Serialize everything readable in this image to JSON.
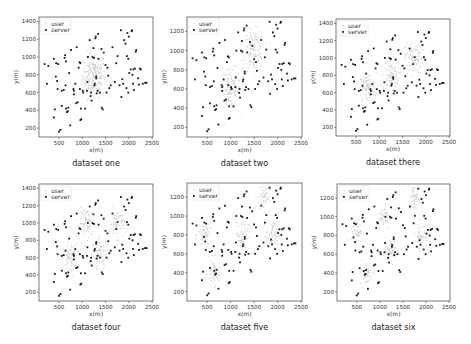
{
  "chart_data": [
    {
      "type": "scatter",
      "title": "dataset one",
      "xlabel": "x(m)",
      "ylabel": "y(m)",
      "xlim": [
        70,
        2520
      ],
      "ylim": [
        100,
        1450
      ],
      "xticks": [
        500,
        1000,
        1500,
        2000,
        2500
      ],
      "yticks": [
        200,
        400,
        600,
        800,
        1000,
        1200,
        1400
      ],
      "legend": [
        "user",
        "server"
      ],
      "legend_position": "upper left",
      "grid": false,
      "user_clusters": [
        {
          "cx": 1250,
          "cy": 800,
          "spread": 180,
          "n": 260
        }
      ],
      "frame": {
        "left": 39,
        "top": 17,
        "right": 153,
        "bottom": 137
      }
    },
    {
      "type": "scatter",
      "title": "dataset two",
      "xlabel": "x(m)",
      "ylabel": "y(m)",
      "xlim": [
        70,
        2520
      ],
      "ylim": [
        100,
        1350
      ],
      "xticks": [
        500,
        1000,
        1500,
        2000,
        2500
      ],
      "yticks": [
        200,
        400,
        600,
        800,
        1000,
        1200
      ],
      "legend": [
        "user",
        "server"
      ],
      "legend_position": "upper left",
      "grid": false,
      "user_clusters": [
        {
          "cx": 1000,
          "cy": 600,
          "spread": 150,
          "n": 150
        },
        {
          "cx": 1500,
          "cy": 1000,
          "spread": 150,
          "n": 150
        }
      ],
      "frame": {
        "left": 187,
        "top": 17,
        "right": 302,
        "bottom": 137
      }
    },
    {
      "type": "scatter",
      "title": "dataset there",
      "xlabel": "x(m)",
      "ylabel": "y(m)",
      "xlim": [
        70,
        2520
      ],
      "ylim": [
        100,
        1450
      ],
      "xticks": [
        500,
        1000,
        1500,
        2000,
        2500
      ],
      "yticks": [
        200,
        400,
        600,
        800,
        1000,
        1200,
        1400
      ],
      "legend": [
        "user",
        "server"
      ],
      "legend_position": "upper left",
      "grid": false,
      "user_clusters": [
        {
          "cx": 750,
          "cy": 650,
          "spread": 130,
          "n": 110
        },
        {
          "cx": 1250,
          "cy": 800,
          "spread": 130,
          "n": 110
        },
        {
          "cx": 1750,
          "cy": 1000,
          "spread": 130,
          "n": 110
        }
      ],
      "frame": {
        "left": 336,
        "top": 19,
        "right": 450,
        "bottom": 136
      }
    },
    {
      "type": "scatter",
      "title": "dataset four",
      "xlabel": "x(m)",
      "ylabel": "y(m)",
      "xlim": [
        70,
        2520
      ],
      "ylim": [
        100,
        1450
      ],
      "xticks": [
        500,
        1000,
        1500,
        2000,
        2500
      ],
      "yticks": [
        200,
        400,
        600,
        800,
        1000,
        1200,
        1400
      ],
      "legend": [
        "user",
        "server"
      ],
      "legend_position": "upper left",
      "grid": false,
      "user_clusters": [
        {
          "cx": 750,
          "cy": 600,
          "spread": 120,
          "n": 90
        },
        {
          "cx": 1100,
          "cy": 1000,
          "spread": 120,
          "n": 90
        },
        {
          "cx": 1400,
          "cy": 650,
          "spread": 120,
          "n": 90
        },
        {
          "cx": 1750,
          "cy": 1000,
          "spread": 120,
          "n": 90
        }
      ],
      "frame": {
        "left": 39,
        "top": 184,
        "right": 153,
        "bottom": 301
      }
    },
    {
      "type": "scatter",
      "title": "dataset five",
      "xlabel": "x(m)",
      "ylabel": "y(m)",
      "xlim": [
        70,
        2520
      ],
      "ylim": [
        100,
        1350
      ],
      "xticks": [
        500,
        1000,
        1500,
        2000,
        2500
      ],
      "yticks": [
        200,
        400,
        600,
        800,
        1000,
        1200
      ],
      "legend": [
        "user",
        "server"
      ],
      "legend_position": "upper left",
      "grid": false,
      "user_clusters": [
        {
          "cx": 450,
          "cy": 800,
          "spread": 100,
          "n": 70
        },
        {
          "cx": 650,
          "cy": 400,
          "spread": 100,
          "n": 70
        },
        {
          "cx": 1250,
          "cy": 800,
          "spread": 110,
          "n": 70
        },
        {
          "cx": 1700,
          "cy": 1200,
          "spread": 100,
          "n": 70
        },
        {
          "cx": 1900,
          "cy": 800,
          "spread": 100,
          "n": 70
        }
      ],
      "frame": {
        "left": 187,
        "top": 183,
        "right": 302,
        "bottom": 301
      }
    },
    {
      "type": "scatter",
      "title": "dataset six",
      "xlabel": "x(m)",
      "ylabel": "y(m)",
      "xlim": [
        70,
        2520
      ],
      "ylim": [
        100,
        1350
      ],
      "xticks": [
        500,
        1000,
        1500,
        2000,
        2500
      ],
      "yticks": [
        200,
        400,
        600,
        800,
        1000,
        1200
      ],
      "legend": [
        "user",
        "server"
      ],
      "legend_position": "upper left",
      "grid": false,
      "user_clusters": [
        {
          "cx": 500,
          "cy": 850,
          "spread": 90,
          "n": 60
        },
        {
          "cx": 1100,
          "cy": 1000,
          "spread": 90,
          "n": 60
        },
        {
          "cx": 1250,
          "cy": 650,
          "spread": 90,
          "n": 60
        },
        {
          "cx": 1750,
          "cy": 1200,
          "spread": 90,
          "n": 60
        },
        {
          "cx": 1900,
          "cy": 800,
          "spread": 90,
          "n": 60
        },
        {
          "cx": 700,
          "cy": 400,
          "spread": 90,
          "n": 60
        }
      ],
      "frame": {
        "left": 337,
        "top": 184,
        "right": 450,
        "bottom": 301
      }
    }
  ],
  "servers": [
    [
      190,
      920
    ],
    [
      270,
      900
    ],
    [
      240,
      700
    ],
    [
      390,
      980
    ],
    [
      440,
      930
    ],
    [
      480,
      920
    ],
    [
      430,
      780
    ],
    [
      460,
      730
    ],
    [
      410,
      410
    ],
    [
      390,
      320
    ],
    [
      470,
      640
    ],
    [
      500,
      160
    ],
    [
      530,
      180
    ],
    [
      560,
      450
    ],
    [
      620,
      990
    ],
    [
      630,
      1020
    ],
    [
      650,
      950
    ],
    [
      600,
      630
    ],
    [
      640,
      680
    ],
    [
      650,
      420
    ],
    [
      670,
      380
    ],
    [
      690,
      390
    ],
    [
      700,
      430
    ],
    [
      740,
      230
    ],
    [
      720,
      820
    ],
    [
      760,
      1080
    ],
    [
      810,
      640
    ],
    [
      820,
      620
    ],
    [
      820,
      580
    ],
    [
      850,
      700
    ],
    [
      880,
      1110
    ],
    [
      870,
      480
    ],
    [
      900,
      490
    ],
    [
      920,
      880
    ],
    [
      940,
      940
    ],
    [
      960,
      930
    ],
    [
      970,
      420
    ],
    [
      960,
      290
    ],
    [
      980,
      300
    ],
    [
      1010,
      620
    ],
    [
      1020,
      600
    ],
    [
      1060,
      420
    ],
    [
      1100,
      620
    ],
    [
      1110,
      720
    ],
    [
      1160,
      1190
    ],
    [
      1180,
      560
    ],
    [
      1200,
      510
    ],
    [
      1190,
      600
    ],
    [
      1220,
      1000
    ],
    [
      1240,
      1100
    ],
    [
      1250,
      990
    ],
    [
      1260,
      680
    ],
    [
      1270,
      700
    ],
    [
      1280,
      1210
    ],
    [
      1290,
      1230
    ],
    [
      1300,
      780
    ],
    [
      1300,
      760
    ],
    [
      1310,
      590
    ],
    [
      1340,
      1260
    ],
    [
      1350,
      980
    ],
    [
      1380,
      600
    ],
    [
      1410,
      1090
    ],
    [
      1420,
      430
    ],
    [
      1440,
      410
    ],
    [
      1460,
      1050
    ],
    [
      1500,
      910
    ],
    [
      1520,
      600
    ],
    [
      1540,
      880
    ],
    [
      1560,
      790
    ],
    [
      1580,
      650
    ],
    [
      1610,
      680
    ],
    [
      1650,
      1110
    ],
    [
      1700,
      720
    ],
    [
      1730,
      930
    ],
    [
      1760,
      1010
    ],
    [
      1800,
      680
    ],
    [
      1830,
      1300
    ],
    [
      1840,
      550
    ],
    [
      1860,
      750
    ],
    [
      1880,
      700
    ],
    [
      1900,
      1190
    ],
    [
      1930,
      1150
    ],
    [
      1950,
      650
    ],
    [
      1960,
      1010
    ],
    [
      1970,
      1270
    ],
    [
      1990,
      600
    ],
    [
      2000,
      1230
    ],
    [
      2010,
      820
    ],
    [
      2040,
      860
    ],
    [
      2060,
      1290
    ],
    [
      2070,
      1300
    ],
    [
      2080,
      800
    ],
    [
      2090,
      700
    ],
    [
      2100,
      860
    ],
    [
      2110,
      630
    ],
    [
      2130,
      870
    ],
    [
      2150,
      1060
    ],
    [
      2160,
      1080
    ],
    [
      2200,
      760
    ],
    [
      2220,
      690
    ],
    [
      2240,
      870
    ],
    [
      2260,
      860
    ],
    [
      2300,
      700
    ],
    [
      2350,
      710
    ],
    [
      2380,
      710
    ],
    [
      1120,
      1000
    ],
    [
      1330,
      620
    ],
    [
      950,
      640
    ],
    [
      560,
      620
    ],
    [
      1990,
      980
    ]
  ],
  "figure": {
    "user_color": "#c8c8c8",
    "server_color": "#1a1a1a",
    "frame_color": "#444444"
  }
}
